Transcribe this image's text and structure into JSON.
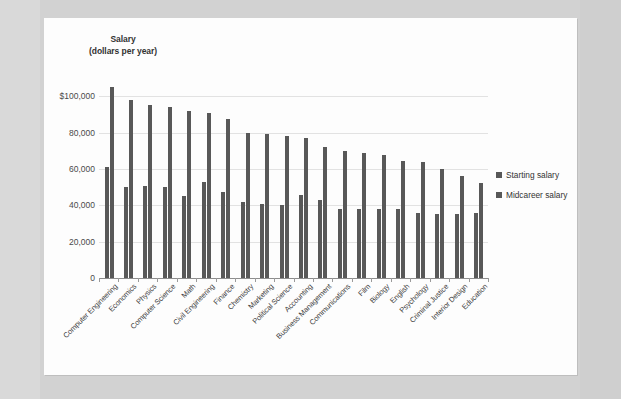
{
  "chart_data": {
    "type": "bar",
    "title": "Salary\n(dollars per year)",
    "title_line1": "Salary",
    "title_line2": "(dollars per year)",
    "xlabel": "",
    "ylabel": "Salary (dollars per year)",
    "ylim": [
      0,
      110000
    ],
    "ytick_labels": [
      "$100,000",
      "80,000",
      "60,000",
      "40,000",
      "20,000",
      "0"
    ],
    "ytick_values": [
      100000,
      80000,
      60000,
      40000,
      20000,
      0
    ],
    "grid": true,
    "legend_position": "right",
    "bar_color": "#585858",
    "categories": [
      "Computer Engineering",
      "Economics",
      "Physics",
      "Computer Science",
      "Math",
      "Civil Engineering",
      "Finance",
      "Chemistry",
      "Marketing",
      "Political Science",
      "Accounting",
      "Business Management",
      "Communications",
      "Film",
      "Biology",
      "English",
      "Psychology",
      "Criminal Justice",
      "Interior Design",
      "Education"
    ],
    "series": [
      {
        "name": "Starting salary",
        "values": [
          61000,
          50000,
          50500,
          50000,
          45000,
          53000,
          47500,
          42000,
          40800,
          40000,
          45500,
          43000,
          38000,
          37800,
          38000,
          38000,
          35500,
          35000,
          35000,
          36000
        ]
      },
      {
        "name": "Midcareer salary",
        "values": [
          105000,
          98000,
          95000,
          94000,
          92000,
          90500,
          87500,
          80000,
          79000,
          78000,
          77000,
          72000,
          70000,
          69000,
          67500,
          64500,
          64000,
          60000,
          56000,
          52500
        ]
      }
    ]
  },
  "legend": {
    "entries": [
      "Starting salary",
      "Midcareer salary"
    ]
  }
}
